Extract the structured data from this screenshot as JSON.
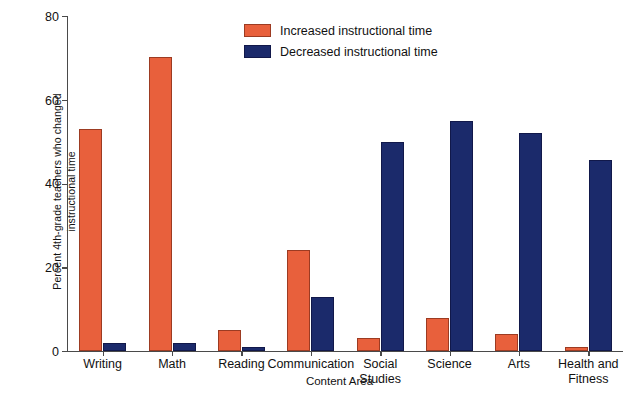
{
  "chart_data": {
    "type": "bar",
    "title": "",
    "xlabel": "Content Area",
    "ylabel_line1": "Percent 4th-grade teachers who changed",
    "ylabel_line2": "instructional time",
    "ylim": [
      0,
      80
    ],
    "yticks": [
      0,
      20,
      40,
      60,
      80
    ],
    "ytick_labels": [
      "0",
      "20",
      "40",
      "60",
      "80"
    ],
    "grid": false,
    "legend_position": "top-center",
    "categories": [
      "Writing",
      "Math",
      "Reading",
      "Communication",
      "Social Studies",
      "Science",
      "Arts",
      "Health and Fitness"
    ],
    "category_lines": [
      [
        "Writing",
        ""
      ],
      [
        "Math",
        ""
      ],
      [
        "Reading",
        ""
      ],
      [
        "Communication",
        ""
      ],
      [
        "Social",
        "Studies"
      ],
      [
        "Science",
        ""
      ],
      [
        "Arts",
        ""
      ],
      [
        "Health and",
        "Fitness"
      ]
    ],
    "series": [
      {
        "name": "Increased instructional time",
        "color": "#E8603C",
        "values": [
          53,
          70.3,
          5,
          24.2,
          3,
          8,
          4,
          1
        ]
      },
      {
        "name": "Decreased instructional time",
        "color": "#1B2A6B",
        "values": [
          2,
          2,
          1,
          13,
          50,
          55,
          52,
          45.6
        ]
      }
    ]
  },
  "legend": {
    "items": [
      {
        "label": "Increased instructional time",
        "color": "#E8603C"
      },
      {
        "label": "Decreased instructional time",
        "color": "#1B2A6B"
      }
    ]
  },
  "axes": {
    "y_title_line1": "Percent 4th-grade teachers who changed",
    "y_title_line2": "instructional time",
    "x_title": "Content Area",
    "ytick_0": "0",
    "ytick_1": "20",
    "ytick_2": "40",
    "ytick_3": "60",
    "ytick_4": "80"
  },
  "colors": {
    "increased": "#E8603C",
    "decreased": "#1B2A6B",
    "axis": "#4a4a4a",
    "background": "#ffffff",
    "text": "#111111"
  }
}
